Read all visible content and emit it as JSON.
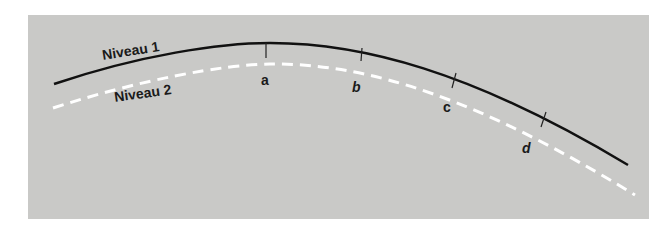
{
  "diagram": {
    "background_color": "#c9c9c7",
    "curves": [
      {
        "name": "Niveau 1",
        "style": "solid",
        "color": "#111111"
      },
      {
        "name": "Niveau 2",
        "style": "dashed",
        "color": "#ffffff"
      }
    ],
    "labels": {
      "niveau1": "Niveau 1",
      "niveau2": "Niveau 2"
    },
    "points": [
      "a",
      "b",
      "c",
      "d"
    ]
  }
}
